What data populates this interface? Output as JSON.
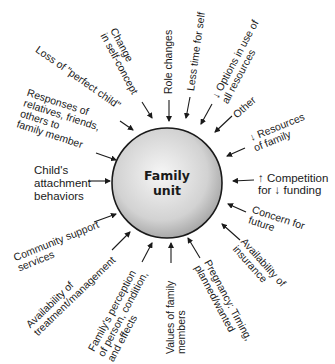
{
  "center": {
    "line1": "Family",
    "line2": "unit"
  },
  "factors": [
    {
      "id": "change-self-concept",
      "text": "Change\nin self-concept"
    },
    {
      "id": "role-changes",
      "text": "Role changes"
    },
    {
      "id": "less-time-self",
      "text": "Less time for self"
    },
    {
      "id": "options-resources",
      "text": "↓ Options in use of\nall resources"
    },
    {
      "id": "other",
      "text": "Other"
    },
    {
      "id": "resources-family",
      "text": "↓ Resources\nof family"
    },
    {
      "id": "competition-funding",
      "text": "↑ Competition\nfor ↓ funding"
    },
    {
      "id": "concern-future",
      "text": "Concern for\nfuture"
    },
    {
      "id": "availability-insurance",
      "text": "Availability of\ninsurance"
    },
    {
      "id": "pregnancy",
      "text": "Pregnancy: Timing,\nplanned/wanted"
    },
    {
      "id": "values-family",
      "text": "Values of family\nmembers"
    },
    {
      "id": "family-perception",
      "text": "Family's perception\nof person, condition,\nand effects"
    },
    {
      "id": "availability-treatment",
      "text": "Availability of\ntreatment/management"
    },
    {
      "id": "community-support",
      "text": "Community support\nservices"
    },
    {
      "id": "attachment-behaviors",
      "text": "Child's\nattachment\nbehaviors"
    },
    {
      "id": "responses-relatives",
      "text": "Responses of\nrelatives, friends,\nothers to\nfamily member"
    },
    {
      "id": "loss-perfect-child",
      "text": "Loss of \"perfect child\""
    }
  ],
  "colors": {
    "circle_fill_center": "#f4f4f4",
    "circle_fill_edge": "#a9a9a9",
    "stroke": "#1a1a1a"
  }
}
